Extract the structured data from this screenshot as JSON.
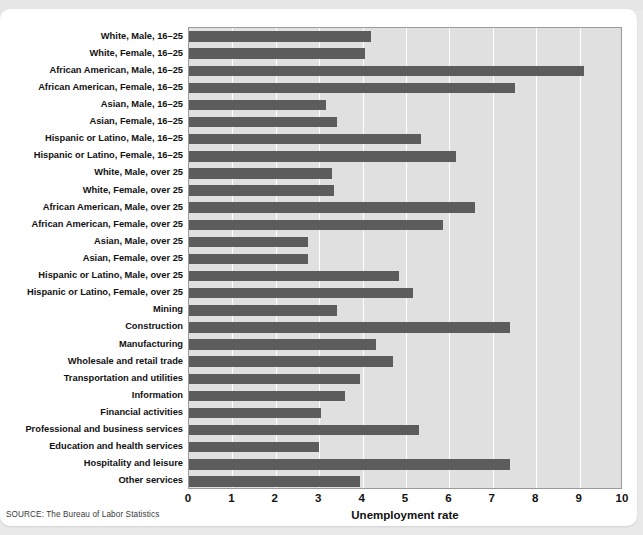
{
  "figure": {
    "source_note": "SOURCE: The Bureau of Labor Statistics",
    "bar_color": "#5c5c5c",
    "plot_bg": "#e0e0e0",
    "grid_color": "#ffffff",
    "page_bg": "#e9e9e9",
    "card_bg": "#ffffff"
  },
  "chart_data": {
    "type": "bar",
    "orientation": "horizontal",
    "title": "",
    "subtitle": "",
    "xlabel": "Unemployment rate",
    "ylabel": "",
    "xlim": [
      0,
      10
    ],
    "xticks": [
      0,
      1,
      2,
      3,
      4,
      5,
      6,
      7,
      8,
      9,
      10
    ],
    "xticklabels": [
      "0",
      "1",
      "2",
      "3",
      "4",
      "5",
      "6",
      "7",
      "8",
      "9",
      "10"
    ],
    "grid": "vertical",
    "legend": "none",
    "categories": [
      "White, Male, 16–25",
      "White, Female, 16–25",
      "African American, Male, 16–25",
      "African American, Female, 16–25",
      "Asian, Male, 16–25",
      "Asian, Female, 16–25",
      "Hispanic or Latino, Male, 16–25",
      "Hispanic or Latino, Female, 16–25",
      "White, Male, over 25",
      "White, Female, over 25",
      "African American, Male, over 25",
      "African American, Female, over 25",
      "Asian, Male, over 25",
      "Asian, Female, over 25",
      "Hispanic or Latino, Male, over 25",
      "Hispanic or Latino, Female, over 25",
      "Mining",
      "Construction",
      "Manufacturing",
      "Wholesale and retail trade",
      "Transportation and utilities",
      "Information",
      "Financial activities",
      "Professional and business services",
      "Education and health services",
      "Hospitality and leisure",
      "Other services"
    ],
    "values": [
      4.2,
      4.05,
      9.1,
      7.5,
      3.15,
      3.4,
      5.35,
      6.15,
      3.3,
      3.35,
      6.6,
      5.85,
      2.75,
      2.75,
      4.85,
      5.15,
      3.4,
      7.4,
      4.3,
      4.7,
      3.95,
      3.6,
      3.05,
      5.3,
      3.0,
      7.4,
      3.95
    ]
  }
}
